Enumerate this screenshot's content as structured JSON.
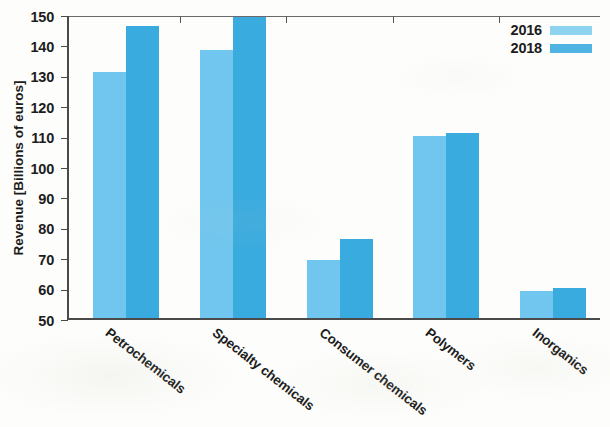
{
  "chart_data": {
    "type": "bar",
    "title": "",
    "subtitle": "",
    "xlabel": "",
    "ylabel": "Revenue [Billions of euros]",
    "categories": [
      "Petrochemicals",
      "Specialty chemicals",
      "Consumer chemicals",
      "Polymers",
      "Inorganics"
    ],
    "series": [
      {
        "name": "2016",
        "color": "#70c6ee",
        "values": [
          131,
          138,
          69,
          110,
          59
        ]
      },
      {
        "name": "2018",
        "color": "#3aabdf",
        "values": [
          146,
          149,
          76,
          111,
          60
        ]
      }
    ],
    "ylim": [
      50,
      150
    ],
    "ytick_values": [
      150,
      140,
      130,
      120,
      110,
      100,
      90,
      80,
      70,
      60,
      50
    ],
    "ytick_labels": [
      "150",
      "140",
      "130",
      "120",
      "110",
      "100",
      "90",
      "80",
      "70",
      "60",
      "50"
    ],
    "grid": false,
    "legend_position": "top-right-inside",
    "legend_entries": [
      "2016",
      "2018"
    ]
  },
  "legend": {
    "entries": [
      {
        "label": "2016",
        "swatch_color": "#8ed3f0"
      },
      {
        "label": "2018",
        "swatch_color": "#4fb4e2"
      }
    ]
  },
  "axes": {
    "y_title": "Revenue [Billions of euros]",
    "y_ticks": [
      "150",
      "140",
      "130",
      "120",
      "110",
      "100",
      "90",
      "80",
      "70",
      "60",
      "50"
    ],
    "x_categories": [
      "Petrochemicals",
      "Specialty chemicals",
      "Consumer chemicals",
      "Polymers",
      "Inorganics"
    ]
  },
  "colors": {
    "series_2016": "#70c6ee",
    "series_2018": "#3aabdf",
    "axis": "#4a4a4a",
    "text": "#1c1c1c",
    "background": "#fdfdfb"
  }
}
